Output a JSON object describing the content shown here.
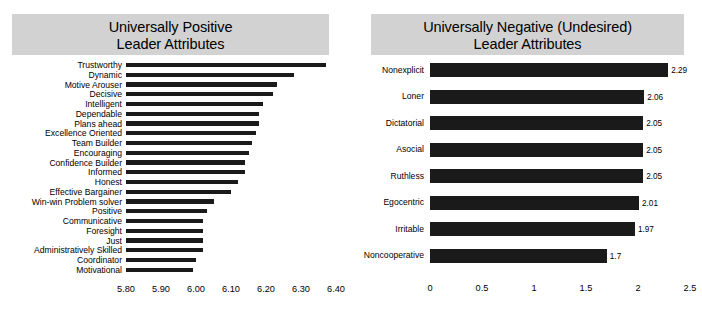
{
  "charts": {
    "positive": {
      "title_line1": "Universally Positive",
      "title_line2": "Leader Attributes"
    },
    "negative": {
      "title_line1": "Universally Negative (Undesired)",
      "title_line2": "Leader Attributes"
    }
  },
  "chart_data": [
    {
      "type": "bar",
      "orientation": "horizontal",
      "title": "Universally Positive Leader Attributes",
      "xlabel": "",
      "ylabel": "",
      "xlim": [
        5.8,
        6.4
      ],
      "grid": false,
      "legend": "none",
      "bar_color": "#1a1a1a",
      "value_labels_shown": false,
      "tick_labels": [
        "5.80",
        "5.90",
        "6.00",
        "6.10",
        "6.20",
        "6.30",
        "6.40"
      ],
      "ticks": [
        5.8,
        5.9,
        6.0,
        6.1,
        6.2,
        6.3,
        6.4
      ],
      "categories": [
        "Trustworthy",
        "Dynamic",
        "Motive Arouser",
        "Decisive",
        "Intelligent",
        "Dependable",
        "Plans ahead",
        "Excellence Oriented",
        "Team Builder",
        "Encouraging",
        "Confidence Builder",
        "Informed",
        "Honest",
        "Effective Bargainer",
        "Win-win Problem solver",
        "Positive",
        "Communicative",
        "Foresight",
        "Just",
        "Administratively Skilled",
        "Coordinator",
        "Motivational"
      ],
      "values": [
        6.37,
        6.28,
        6.23,
        6.22,
        6.19,
        6.18,
        6.18,
        6.17,
        6.16,
        6.15,
        6.14,
        6.14,
        6.12,
        6.1,
        6.05,
        6.03,
        6.02,
        6.02,
        6.02,
        6.02,
        6.0,
        5.99
      ]
    },
    {
      "type": "bar",
      "orientation": "horizontal",
      "title": "Universally Negative (Undesired) Leader Attributes",
      "xlabel": "",
      "ylabel": "",
      "xlim": [
        0,
        2.5
      ],
      "grid": false,
      "legend": "none",
      "bar_color": "#1a1a1a",
      "value_labels_shown": true,
      "tick_labels": [
        "0",
        "0.5",
        "1",
        "1.5",
        "2",
        "2.5"
      ],
      "ticks": [
        0,
        0.5,
        1,
        1.5,
        2,
        2.5
      ],
      "categories": [
        "Nonexplicit",
        "Loner",
        "Dictatorial",
        "Asocial",
        "Ruthless",
        "Egocentric",
        "Irritable",
        "Noncooperative"
      ],
      "values": [
        2.29,
        2.06,
        2.05,
        2.05,
        2.05,
        2.01,
        1.97,
        1.7
      ],
      "value_labels": [
        "2.29",
        "2.06",
        "2.05",
        "2.05",
        "2.05",
        "2.01",
        "1.97",
        "1.7"
      ]
    }
  ]
}
